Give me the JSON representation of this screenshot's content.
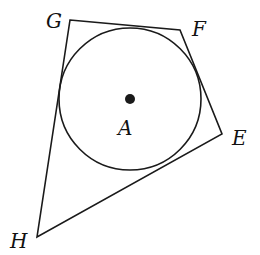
{
  "diagram": {
    "circle": {
      "label": "A",
      "cx": 130,
      "cy": 99,
      "r": 71
    },
    "vertices": [
      {
        "label": "G",
        "x": 70,
        "y": 20,
        "lx": 46,
        "ly": 28
      },
      {
        "label": "F",
        "x": 180,
        "y": 30,
        "lx": 192,
        "ly": 36
      },
      {
        "label": "E",
        "x": 222,
        "y": 134,
        "lx": 232,
        "ly": 145
      },
      {
        "label": "H",
        "x": 37,
        "y": 237,
        "lx": 10,
        "ly": 248
      }
    ],
    "center_label": {
      "text": "A",
      "x": 118,
      "y": 135
    },
    "stroke_color": "#1a1a1a"
  }
}
